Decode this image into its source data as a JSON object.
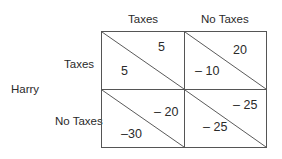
{
  "players": {
    "row_player": "Harry",
    "column_player": ""
  },
  "column_strategies": [
    "Taxes",
    "No Taxes"
  ],
  "row_strategies": [
    "Taxes",
    "No Taxes"
  ],
  "payoffs": [
    [
      {
        "upper_right": "5",
        "lower_left": "5"
      },
      {
        "upper_right": "20",
        "lower_left": "– 10"
      }
    ],
    [
      {
        "upper_right": "– 20",
        "lower_left": "–30"
      },
      {
        "upper_right": "– 25",
        "lower_left": "– 25"
      }
    ]
  ],
  "colors": {
    "line": "#555555",
    "text": "#2a2a2a"
  }
}
